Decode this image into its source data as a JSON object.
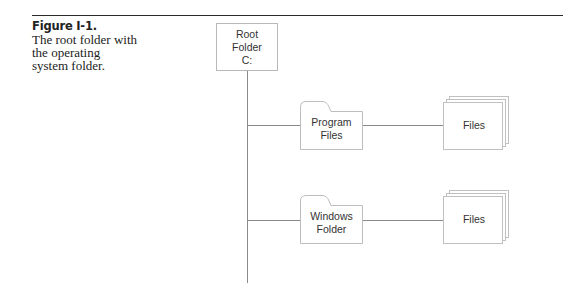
{
  "caption": {
    "figure_label": "Figure I-1.",
    "lines": [
      "The root folder with",
      "the operating",
      "system folder."
    ]
  },
  "diagram": {
    "root": {
      "lines": [
        "Root",
        "Folder",
        "C:"
      ]
    },
    "branches": [
      {
        "folder": {
          "lines": [
            "Program",
            "Files"
          ],
          "icon": "folder-icon"
        },
        "files": {
          "label": "Files",
          "icon": "stacked-pages-icon"
        }
      },
      {
        "folder": {
          "lines": [
            "Windows",
            "Folder"
          ],
          "icon": "folder-icon"
        },
        "files": {
          "label": "Files",
          "icon": "stacked-pages-icon"
        }
      }
    ]
  }
}
